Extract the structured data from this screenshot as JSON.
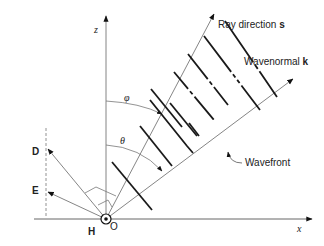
{
  "diagram": {
    "axes": {
      "z_label": "z",
      "x_label": "x",
      "origin_label": "O"
    },
    "vectors": {
      "ray": {
        "label_text": "Ray direction ",
        "label_bold": "s"
      },
      "wavenormal": {
        "label_text": "Wavenormal ",
        "label_bold": "k"
      },
      "D": {
        "label": "D"
      },
      "E": {
        "label": "E"
      },
      "H": {
        "label": "H"
      }
    },
    "angles": {
      "phi": "φ",
      "theta": "θ"
    },
    "wavefront_label": "Wavefront",
    "colors": {
      "thin_line": "#777777",
      "thick_line": "#1a1a1a",
      "text": "#222222"
    }
  }
}
